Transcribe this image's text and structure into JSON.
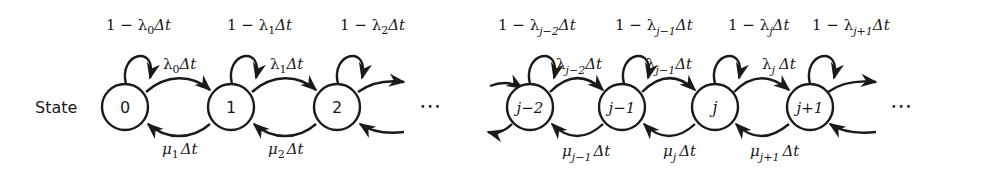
{
  "diagram": {
    "type": "birth-death state transition diagram",
    "row_label": "State",
    "ellipsis": "⋯",
    "nodes": [
      {
        "id": "0",
        "label": "0"
      },
      {
        "id": "1",
        "label": "1"
      },
      {
        "id": "2",
        "label": "2"
      },
      {
        "id": "j-2",
        "label": "j−2"
      },
      {
        "id": "j-1",
        "label": "j−1"
      },
      {
        "id": "j",
        "label": "j"
      },
      {
        "id": "j+1",
        "label": "j+1"
      }
    ],
    "self_loops": [
      {
        "node": "0",
        "pre": "1 − λ",
        "sub": "0",
        "post": "Δt"
      },
      {
        "node": "1",
        "pre": "1 − λ",
        "sub": "1",
        "post": "Δt"
      },
      {
        "node": "2",
        "pre": "1 − λ",
        "sub": "2",
        "post": "Δt"
      },
      {
        "node": "j-2",
        "pre": "1 − λ",
        "sub": "j−2",
        "post": "Δt"
      },
      {
        "node": "j-1",
        "pre": "1 − λ",
        "sub": "j−1",
        "post": "Δt"
      },
      {
        "node": "j",
        "pre": "1 − λ",
        "sub": "j",
        "post": "Δt"
      },
      {
        "node": "j+1",
        "pre": "1 − λ",
        "sub": "j+1",
        "post": "Δt"
      }
    ],
    "forward_edges": [
      {
        "from": "0",
        "to": "1",
        "sym": "λ",
        "sub": "0",
        "post": "Δt"
      },
      {
        "from": "1",
        "to": "2",
        "sym": "λ",
        "sub": "1",
        "post": "Δt"
      },
      {
        "from": "j-2",
        "to": "j-1",
        "sym": "λ",
        "sub": "j−2",
        "post": "Δt"
      },
      {
        "from": "j-1",
        "to": "j",
        "sym": "λ",
        "sub": "j−1",
        "post": "Δt"
      },
      {
        "from": "j",
        "to": "j+1",
        "sym": "λ",
        "sub": "j",
        "post": "Δt"
      }
    ],
    "backward_edges": [
      {
        "from": "1",
        "to": "0",
        "sym": "μ",
        "sub": "1",
        "post": "Δt"
      },
      {
        "from": "2",
        "to": "1",
        "sym": "μ",
        "sub": "2",
        "post": "Δt"
      },
      {
        "from": "j-1",
        "to": "j-2",
        "sym": "μ",
        "sub": "j−1",
        "post": "Δt"
      },
      {
        "from": "j",
        "to": "j-1",
        "sym": "μ",
        "sub": "j",
        "post": "Δt"
      },
      {
        "from": "j+1",
        "to": "j",
        "sym": "μ",
        "sub": "j+1",
        "post": "Δt"
      }
    ]
  }
}
